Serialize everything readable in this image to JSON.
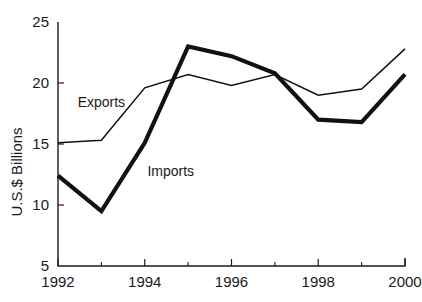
{
  "chart_data": {
    "type": "line",
    "title": "",
    "subtitle": "",
    "xlabel": "",
    "ylabel": "U.S.$ Billions",
    "x": [
      1992,
      1993,
      1994,
      1995,
      1996,
      1997,
      1998,
      1999,
      2000
    ],
    "xlim": [
      1992,
      2000
    ],
    "ylim": [
      5,
      25
    ],
    "grid": false,
    "legend_position": "inline-annotations",
    "x_tick_labels": [
      "1992",
      "1994",
      "1996",
      "1998",
      "2000"
    ],
    "x_tick_values": [
      1992,
      1994,
      1996,
      1998,
      2000
    ],
    "x_minor_tick_values": [
      1993,
      1995,
      1997,
      1999
    ],
    "y_tick_labels": [
      "5",
      "10",
      "15",
      "20",
      "25"
    ],
    "y_tick_values": [
      5,
      10,
      15,
      20,
      25
    ],
    "series": [
      {
        "name": "Exports",
        "style": "thin",
        "values": [
          15.1,
          15.3,
          19.6,
          20.7,
          19.8,
          20.7,
          19.0,
          19.5,
          22.8
        ],
        "label_text": "Exports",
        "label_x": 1993.0,
        "label_y": 18.0
      },
      {
        "name": "Imports",
        "style": "thick",
        "values": [
          12.4,
          9.5,
          15.1,
          23.0,
          22.2,
          20.8,
          17.0,
          16.8,
          20.7
        ],
        "label_text": "Imports",
        "label_x": 1994.6,
        "label_y": 12.4
      }
    ]
  },
  "colors": {
    "line": "#111111",
    "axis": "#1a1a1a",
    "text": "#1a1a1a",
    "background": "#ffffff"
  }
}
